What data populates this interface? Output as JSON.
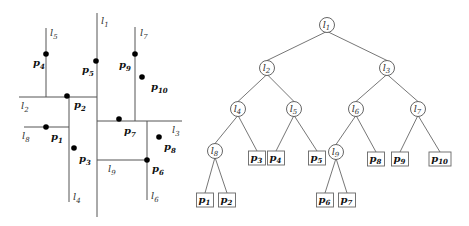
{
  "partition": {
    "lines": [
      {
        "id": "l1",
        "label": "l",
        "sub": "1",
        "x1": 97,
        "y1": 13,
        "x2": 97,
        "y2": 217,
        "lx": 101,
        "ly": 24
      },
      {
        "id": "l2",
        "label": "l",
        "sub": "2",
        "x1": 19,
        "y1": 97,
        "x2": 97,
        "y2": 97,
        "lx": 21,
        "ly": 109
      },
      {
        "id": "l3",
        "label": "l",
        "sub": "3",
        "x1": 97,
        "y1": 121,
        "x2": 182,
        "y2": 121,
        "lx": 172,
        "ly": 133
      },
      {
        "id": "l4",
        "label": "l",
        "sub": "4",
        "x1": 69,
        "y1": 97,
        "x2": 69,
        "y2": 202,
        "lx": 73,
        "ly": 200
      },
      {
        "id": "l5",
        "label": "l",
        "sub": "5",
        "x1": 46,
        "y1": 28,
        "x2": 46,
        "y2": 97,
        "lx": 50,
        "ly": 36
      },
      {
        "id": "l6",
        "label": "l",
        "sub": "6",
        "x1": 147,
        "y1": 121,
        "x2": 147,
        "y2": 200,
        "lx": 151,
        "ly": 199
      },
      {
        "id": "l7",
        "label": "l",
        "sub": "7",
        "x1": 135,
        "y1": 27,
        "x2": 135,
        "y2": 121,
        "lx": 140,
        "ly": 36
      },
      {
        "id": "l8",
        "label": "l",
        "sub": "8",
        "x1": 24,
        "y1": 127,
        "x2": 69,
        "y2": 127,
        "lx": 22,
        "ly": 139
      },
      {
        "id": "l9",
        "label": "l",
        "sub": "9",
        "x1": 97,
        "y1": 160,
        "x2": 147,
        "y2": 160,
        "lx": 108,
        "ly": 172
      }
    ],
    "points": [
      {
        "id": "p1",
        "label": "p",
        "sub": "1",
        "x": 46,
        "y": 127,
        "lx": 51,
        "ly": 140
      },
      {
        "id": "p2",
        "label": "p",
        "sub": "2",
        "x": 67,
        "y": 96,
        "lx": 74,
        "ly": 108
      },
      {
        "id": "p3",
        "label": "p",
        "sub": "3",
        "x": 74,
        "y": 148,
        "lx": 79,
        "ly": 162
      },
      {
        "id": "p4",
        "label": "p",
        "sub": "4",
        "x": 46,
        "y": 54,
        "lx": 33,
        "ly": 66
      },
      {
        "id": "p5",
        "label": "p",
        "sub": "5",
        "x": 96,
        "y": 61,
        "lx": 82,
        "ly": 73
      },
      {
        "id": "p6",
        "label": "p",
        "sub": "6",
        "x": 147,
        "y": 160,
        "lx": 152,
        "ly": 172
      },
      {
        "id": "p7",
        "label": "p",
        "sub": "7",
        "x": 119,
        "y": 119,
        "lx": 124,
        "ly": 134
      },
      {
        "id": "p8",
        "label": "p",
        "sub": "8",
        "x": 159,
        "y": 137,
        "lx": 164,
        "ly": 150
      },
      {
        "id": "p9",
        "label": "p",
        "sub": "9",
        "x": 135,
        "y": 54,
        "lx": 119,
        "ly": 68
      },
      {
        "id": "p10",
        "label": "p",
        "sub": "10",
        "x": 142,
        "y": 77,
        "lx": 151,
        "ly": 90
      }
    ]
  },
  "tree": {
    "internal_nodes": [
      {
        "id": "l1",
        "label": "l",
        "sub": "1",
        "x": 327,
        "y": 25
      },
      {
        "id": "l2",
        "label": "l",
        "sub": "2",
        "x": 267,
        "y": 68
      },
      {
        "id": "l3",
        "label": "l",
        "sub": "3",
        "x": 387,
        "y": 68
      },
      {
        "id": "l4",
        "label": "l",
        "sub": "4",
        "x": 238,
        "y": 109
      },
      {
        "id": "l5",
        "label": "l",
        "sub": "5",
        "x": 294,
        "y": 109
      },
      {
        "id": "l6",
        "label": "l",
        "sub": "6",
        "x": 356,
        "y": 109
      },
      {
        "id": "l7",
        "label": "l",
        "sub": "7",
        "x": 418,
        "y": 109
      },
      {
        "id": "l8",
        "label": "l",
        "sub": "8",
        "x": 215,
        "y": 151
      },
      {
        "id": "l9",
        "label": "l",
        "sub": "9",
        "x": 336,
        "y": 152
      }
    ],
    "leaves": [
      {
        "id": "p1",
        "label": "p",
        "sub": "1",
        "x": 205,
        "y": 200
      },
      {
        "id": "p2",
        "label": "p",
        "sub": "2",
        "x": 227,
        "y": 200
      },
      {
        "id": "p3",
        "label": "p",
        "sub": "3",
        "x": 257,
        "y": 158
      },
      {
        "id": "p4",
        "label": "p",
        "sub": "4",
        "x": 276,
        "y": 158
      },
      {
        "id": "p5",
        "label": "p",
        "sub": "5",
        "x": 317,
        "y": 158
      },
      {
        "id": "p6",
        "label": "p",
        "sub": "6",
        "x": 325,
        "y": 200
      },
      {
        "id": "p7",
        "label": "p",
        "sub": "7",
        "x": 347,
        "y": 200
      },
      {
        "id": "p8",
        "label": "p",
        "sub": "8",
        "x": 376,
        "y": 159
      },
      {
        "id": "p9",
        "label": "p",
        "sub": "9",
        "x": 400,
        "y": 159
      },
      {
        "id": "p10",
        "label": "p",
        "sub": "10",
        "x": 440,
        "y": 159
      }
    ],
    "edges": [
      [
        "l1",
        "l2"
      ],
      [
        "l1",
        "l3"
      ],
      [
        "l2",
        "l4"
      ],
      [
        "l2",
        "l5"
      ],
      [
        "l3",
        "l6"
      ],
      [
        "l3",
        "l7"
      ],
      [
        "l4",
        "l8"
      ],
      [
        "l4",
        "p3"
      ],
      [
        "l5",
        "p4"
      ],
      [
        "l5",
        "p5"
      ],
      [
        "l6",
        "l9"
      ],
      [
        "l6",
        "p8"
      ],
      [
        "l7",
        "p9"
      ],
      [
        "l7",
        "p10"
      ],
      [
        "l8",
        "p1"
      ],
      [
        "l8",
        "p2"
      ],
      [
        "l9",
        "p6"
      ],
      [
        "l9",
        "p7"
      ]
    ]
  }
}
